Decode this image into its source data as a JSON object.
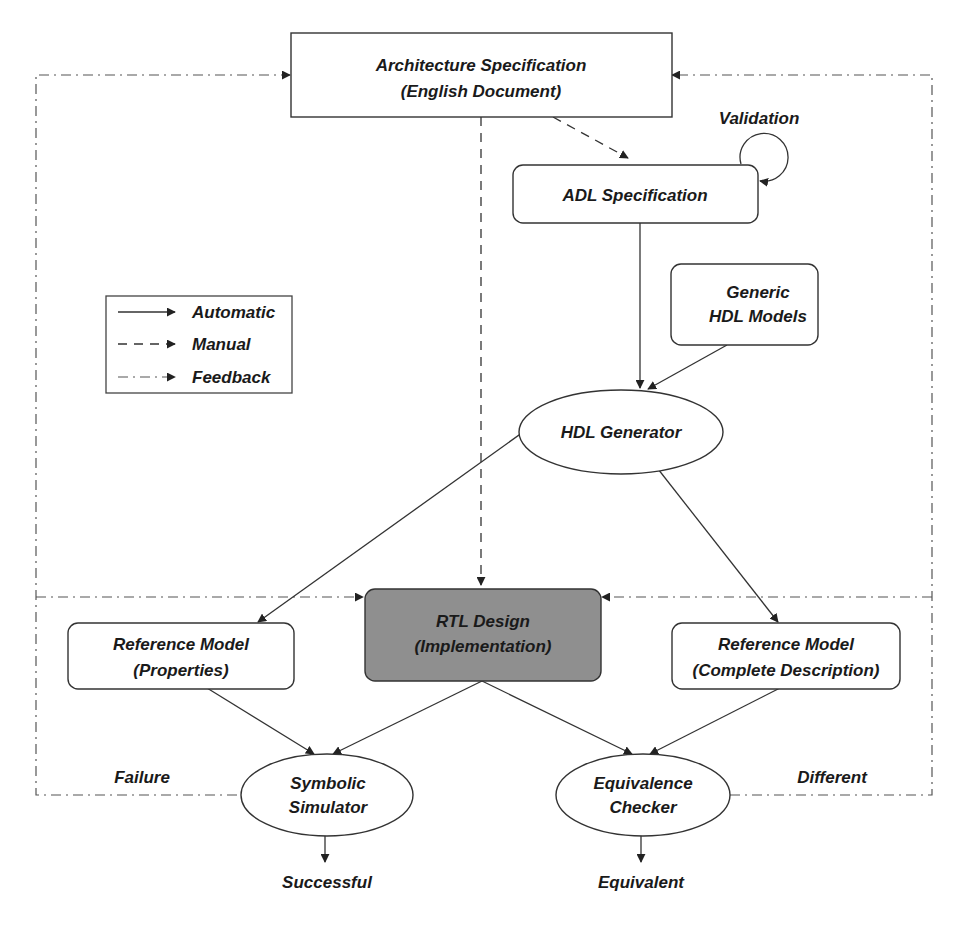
{
  "nodes": {
    "arch_spec": {
      "line1": "Architecture Specification",
      "line2": "(English Document)"
    },
    "adl_spec": {
      "label": "ADL Specification"
    },
    "validation": {
      "label": "Validation"
    },
    "generic_hdl": {
      "line1": "Generic",
      "line2": "HDL Models"
    },
    "hdl_generator": {
      "label": "HDL Generator"
    },
    "rtl_design": {
      "line1": "RTL Design",
      "line2": "(Implementation)"
    },
    "ref_model_props": {
      "line1": "Reference Model",
      "line2": "(Properties)"
    },
    "ref_model_complete": {
      "line1": "Reference Model",
      "line2": "(Complete Description)"
    },
    "symbolic_sim": {
      "line1": "Symbolic",
      "line2": "Simulator"
    },
    "equiv_checker": {
      "line1": "Equivalence",
      "line2": "Checker"
    }
  },
  "outcomes": {
    "failure": "Failure",
    "different": "Different",
    "successful": "Successful",
    "equivalent": "Equivalent"
  },
  "legend": {
    "items": [
      {
        "style": "solid",
        "label": "Automatic"
      },
      {
        "style": "dashed",
        "label": "Manual"
      },
      {
        "style": "dash-dot",
        "label": "Feedback"
      }
    ]
  },
  "colors": {
    "rtl_fill": "#8f8f8f",
    "stroke": "#333333",
    "background": "#ffffff"
  }
}
